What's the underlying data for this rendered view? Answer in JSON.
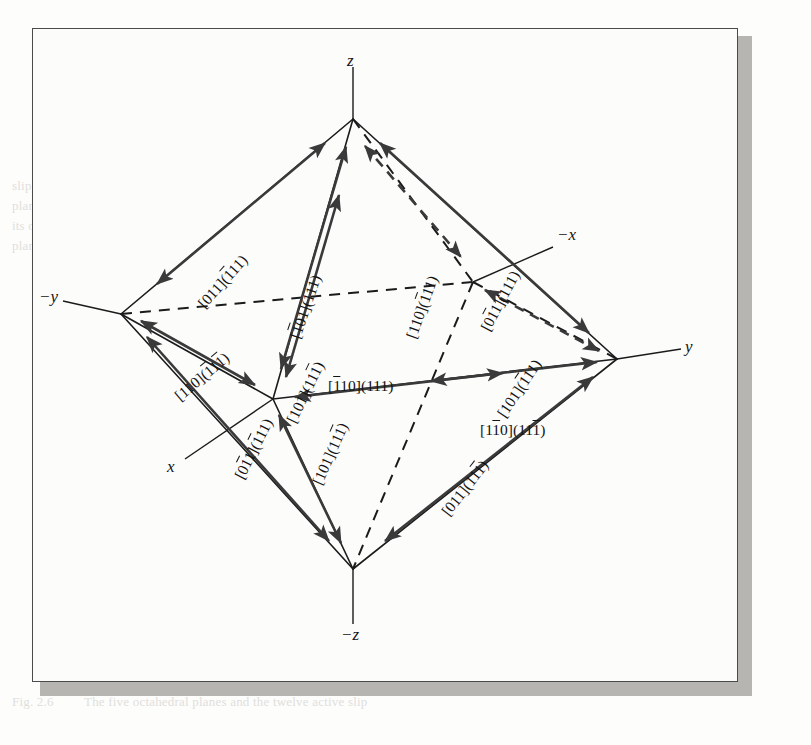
{
  "figure": {
    "type": "crystallographic-octahedron-slip-system-diagram",
    "frame": {
      "border_color": "#4b4b4b",
      "background_color": "#fcfcfb",
      "shadow_color": "#b7b5b2"
    },
    "ink_color": "#1b1b1b",
    "arrow_color": "#3a3a3a"
  },
  "axes": [
    {
      "key": "z",
      "label": "z",
      "overline": false,
      "position": "top"
    },
    {
      "key": "neg_z",
      "label": "−z",
      "overline": false,
      "position": "bottom"
    },
    {
      "key": "y",
      "label": "y",
      "overline": false,
      "position": "right"
    },
    {
      "key": "neg_y",
      "label": "−y",
      "overline": false,
      "position": "left"
    },
    {
      "key": "x",
      "label": "x",
      "overline": false,
      "position": "front-lower-left"
    },
    {
      "key": "neg_x",
      "label": "−x",
      "overline": false,
      "position": "back-upper-right"
    }
  ],
  "slip_systems": [
    {
      "id": "s1",
      "direction": "[011]",
      "plane": "(111)",
      "plane_overline_first": true,
      "text": "[011](1̅1̅1)",
      "display": "[011](̅1 1 1)",
      "parts": [
        {
          "t": "[011](",
          "bar": false
        },
        {
          "t": "1",
          "bar": true
        },
        {
          "t": "11)",
          "bar": false
        }
      ],
      "edge": "neg_y-to-z (upper-left, front)",
      "rotation_deg": -48
    },
    {
      "id": "s2",
      "direction": "[̅1 0 1]",
      "plane": "(111)",
      "text": "[̅1 01](111)",
      "parts": [
        {
          "t": "[",
          "bar": false
        },
        {
          "t": "1",
          "bar": true
        },
        {
          "t": "01](111)",
          "bar": false
        }
      ],
      "edge": "x-to-z (front-left inner)",
      "rotation_deg": -70
    },
    {
      "id": "s3",
      "direction": "[110]",
      "plane": "(̅1 11)",
      "text": "[110](̅1 11)",
      "parts": [
        {
          "t": "[110](",
          "bar": false
        },
        {
          "t": "1",
          "bar": true
        },
        {
          "t": "11)",
          "bar": false
        }
      ],
      "edge": "neg_x-to-z (back, hidden)",
      "rotation_deg": -70
    },
    {
      "id": "s4",
      "direction": "[0̅1 1]",
      "plane": "(111)",
      "text": "[0̅1 1](111)",
      "parts": [
        {
          "t": "[0",
          "bar": false
        },
        {
          "t": "1",
          "bar": true
        },
        {
          "t": "1](111)",
          "bar": false
        }
      ],
      "edge": "y-to-z (upper-right, front)",
      "rotation_deg": -62
    },
    {
      "id": "s5",
      "direction": "[110]",
      "plane": "(̅1 1̅1 )",
      "text": "[110](̅1 1̅1 )",
      "parts": [
        {
          "t": "[110](",
          "bar": false
        },
        {
          "t": "1",
          "bar": true
        },
        {
          "t": "1",
          "bar": false
        },
        {
          "t": "1",
          "bar": true
        },
        {
          "t": ")",
          "bar": false
        }
      ],
      "edge": "neg_y-to-x (left equator, front)",
      "rotation_deg": -40
    },
    {
      "id": "s6",
      "direction": "[101]",
      "plane": "(11̅1 )",
      "text": "[101](11̅1 )",
      "parts": [
        {
          "t": "[101](11",
          "bar": false
        },
        {
          "t": "1",
          "bar": true
        },
        {
          "t": ")",
          "bar": false
        }
      ],
      "edge": "x-to-z (front-left, second)",
      "rotation_deg": -63
    },
    {
      "id": "s7",
      "direction": "[̅1 10]",
      "plane": "(111)",
      "text": "[̅1 10](111)",
      "parts": [
        {
          "t": "[",
          "bar": false
        },
        {
          "t": "1",
          "bar": true
        },
        {
          "t": "10](111)",
          "bar": false
        }
      ],
      "edge": "x-to-y (front equator, upper label)",
      "rotation_deg": 0
    },
    {
      "id": "s8",
      "direction": "[1̅1 0]",
      "plane": "(11̅1 )",
      "text": "[1̅1 0](11̅1 )",
      "parts": [
        {
          "t": "[1",
          "bar": false
        },
        {
          "t": "1",
          "bar": true
        },
        {
          "t": "0](11",
          "bar": false
        },
        {
          "t": "1",
          "bar": true
        },
        {
          "t": ")",
          "bar": false
        }
      ],
      "edge": "x-to-y (front equator, lower label)",
      "rotation_deg": 0
    },
    {
      "id": "s9",
      "direction": "[101]",
      "plane": "(̅1 11)",
      "text": "[101](̅1 11)",
      "parts": [
        {
          "t": "[101](",
          "bar": false
        },
        {
          "t": "1",
          "bar": true
        },
        {
          "t": "11)",
          "bar": false
        }
      ],
      "edge": "neg_x-to-y (back-right, hidden)",
      "rotation_deg": -55
    },
    {
      "id": "s10",
      "direction": "[0̅1 1]",
      "plane": "(̅1 11)",
      "text": "[0̅1 1](̅1 11)",
      "parts": [
        {
          "t": "[0",
          "bar": false
        },
        {
          "t": "1",
          "bar": true
        },
        {
          "t": "1](",
          "bar": false
        },
        {
          "t": "1",
          "bar": true
        },
        {
          "t": "11)",
          "bar": false
        }
      ],
      "edge": "neg_y-to-neg_z (lower-left, front)",
      "rotation_deg": -62
    },
    {
      "id": "s11",
      "direction": "[101]",
      "plane": "(11̅1 )",
      "text": "[101](11̅1 )",
      "parts": [
        {
          "t": "[101](11",
          "bar": false
        },
        {
          "t": "1",
          "bar": true
        },
        {
          "t": ")",
          "bar": false
        }
      ],
      "edge": "x-to-neg_z (front-lower inner)",
      "rotation_deg": -66
    },
    {
      "id": "s12",
      "direction": "[011]",
      "plane": "(11̅1 )",
      "text": "[011](11̅1 )",
      "parts": [
        {
          "t": "[011](11",
          "bar": false
        },
        {
          "t": "1",
          "bar": true
        },
        {
          "t": ")",
          "bar": false
        }
      ],
      "edge": "y-to-neg_z (lower-right, front)",
      "rotation_deg": -52
    }
  ],
  "ghost_text_lines": [
    {
      "x": 84,
      "y": 36,
      "text": "is shown by the vectors attached to the slip system"
    },
    {
      "x": 84,
      "y": 55,
      "text": "in the figure. The slip occurs along the slip direction"
    },
    {
      "x": 84,
      "y": 74,
      "text": "when the resolved shear stress on the plane reaches"
    },
    {
      "x": 12,
      "y": 176,
      "text": "slip on"
    },
    {
      "x": 12,
      "y": 196,
      "text": "planes"
    },
    {
      "x": 12,
      "y": 216,
      "text": "its own"
    },
    {
      "x": 12,
      "y": 236,
      "text": "plane"
    },
    {
      "x": 84,
      "y": 176,
      "text": "If we look at the slip systems, they are usually"
    },
    {
      "x": 84,
      "y": 196,
      "text": "described by the direction and the plane of slip."
    },
    {
      "x": 84,
      "y": 216,
      "text": "These are the directions and planes of the most"
    },
    {
      "x": 84,
      "y": 236,
      "text": "densely packed atoms. For a cubic system"
    },
    {
      "x": 84,
      "y": 256,
      "text": "the planes of the octahedron are those most"
    },
    {
      "x": 84,
      "y": 276,
      "text": "closely packed, and, as noted, these are the field"
    },
    {
      "x": 84,
      "y": 296,
      "text": "the deformation on the crystallographic"
    },
    {
      "x": 84,
      "y": 316,
      "text": "planes which leads to the critical resolved shear"
    },
    {
      "x": 84,
      "y": 336,
      "text": "resolved shear stress on the plane. The flow"
    },
    {
      "x": 84,
      "y": 356,
      "text": "stress is therefore a function of the material. For"
    },
    {
      "x": 84,
      "y": 376,
      "text": "face-centered cubic crystals the (111) planes"
    },
    {
      "x": 84,
      "y": 396,
      "text": "and the directions of the close-packed rows"
    },
    {
      "x": 84,
      "y": 416,
      "text": "are the slip directions, as shown in the figure"
    },
    {
      "x": 84,
      "y": 436,
      "text": "below in which there are twelve systems"
    },
    {
      "x": 12,
      "y": 692,
      "text": "Fig. 2.6"
    },
    {
      "x": 84,
      "y": 692,
      "text": "The five octahedral planes and the twelve active slip"
    }
  ]
}
